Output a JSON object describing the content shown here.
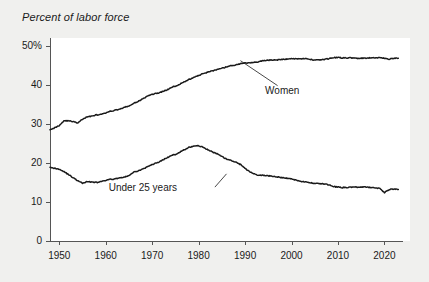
{
  "chart_data": {
    "type": "line",
    "title": "Percent of labor force",
    "xlabel": "",
    "ylabel": "",
    "xlim": [
      1948,
      2024
    ],
    "ylim": [
      0,
      52
    ],
    "grid": false,
    "legend_position": "inline-annotations",
    "y_ticks": [
      {
        "value": 0,
        "label": "0"
      },
      {
        "value": 10,
        "label": "10"
      },
      {
        "value": 20,
        "label": "20"
      },
      {
        "value": 30,
        "label": "30"
      },
      {
        "value": 40,
        "label": "40"
      },
      {
        "value": 50,
        "label": "50%"
      }
    ],
    "x_ticks": [
      {
        "value": 1950,
        "label": "1950"
      },
      {
        "value": 1960,
        "label": "1960"
      },
      {
        "value": 1970,
        "label": "1970"
      },
      {
        "value": 1980,
        "label": "1980"
      },
      {
        "value": 1990,
        "label": "1990"
      },
      {
        "value": 2000,
        "label": "2000"
      },
      {
        "value": 2010,
        "label": "2010"
      },
      {
        "value": 2020,
        "label": "2020"
      }
    ],
    "annotations": [
      {
        "text": "Women",
        "label_x": 1998,
        "label_y": 38.5,
        "leader_from": [
          1997,
          39.8
        ],
        "leader_to": [
          1989,
          46.2
        ]
      },
      {
        "text": "Under 25 years",
        "label_x": 1968,
        "label_y": 13.5,
        "leader_from": [
          1983.5,
          13.8
        ],
        "leader_to": [
          1986,
          17.2
        ]
      }
    ],
    "series": [
      {
        "name": "Women",
        "color": "#1a1a1a",
        "x": [
          1948,
          1949,
          1950,
          1951,
          1952,
          1953,
          1954,
          1955,
          1956,
          1957,
          1958,
          1959,
          1960,
          1961,
          1962,
          1963,
          1964,
          1965,
          1966,
          1967,
          1968,
          1969,
          1970,
          1971,
          1972,
          1973,
          1974,
          1975,
          1976,
          1977,
          1978,
          1979,
          1980,
          1981,
          1982,
          1983,
          1984,
          1985,
          1986,
          1987,
          1988,
          1989,
          1990,
          1991,
          1992,
          1993,
          1994,
          1995,
          1996,
          1997,
          1998,
          1999,
          2000,
          2001,
          2002,
          2003,
          2004,
          2005,
          2006,
          2007,
          2008,
          2009,
          2010,
          2011,
          2012,
          2013,
          2014,
          2015,
          2016,
          2017,
          2018,
          2019,
          2020,
          2021,
          2022,
          2023
        ],
        "values": [
          28.6,
          29.0,
          29.6,
          30.8,
          30.8,
          30.6,
          30.2,
          31.2,
          31.8,
          32.0,
          32.3,
          32.4,
          32.8,
          33.2,
          33.5,
          33.8,
          34.2,
          34.6,
          35.2,
          35.8,
          36.4,
          37.1,
          37.6,
          37.8,
          38.2,
          38.6,
          39.2,
          39.7,
          40.2,
          40.8,
          41.4,
          41.9,
          42.4,
          42.9,
          43.3,
          43.6,
          43.9,
          44.2,
          44.6,
          44.9,
          45.1,
          45.4,
          45.6,
          45.7,
          45.8,
          45.9,
          46.2,
          46.3,
          46.4,
          46.4,
          46.5,
          46.6,
          46.7,
          46.7,
          46.7,
          46.7,
          46.5,
          46.4,
          46.4,
          46.5,
          46.7,
          47.0,
          47.0,
          46.9,
          46.9,
          46.9,
          46.8,
          46.8,
          46.8,
          46.9,
          46.9,
          47.0,
          46.8,
          46.6,
          46.8,
          46.8
        ]
      },
      {
        "name": "Under 25 years",
        "color": "#1a1a1a",
        "x": [
          1948,
          1949,
          1950,
          1951,
          1952,
          1953,
          1954,
          1955,
          1956,
          1957,
          1958,
          1959,
          1960,
          1961,
          1962,
          1963,
          1964,
          1965,
          1966,
          1967,
          1968,
          1969,
          1970,
          1971,
          1972,
          1973,
          1974,
          1975,
          1976,
          1977,
          1978,
          1979,
          1980,
          1981,
          1982,
          1983,
          1984,
          1985,
          1986,
          1987,
          1988,
          1989,
          1990,
          1991,
          1992,
          1993,
          1994,
          1995,
          1996,
          1997,
          1998,
          1999,
          2000,
          2001,
          2002,
          2003,
          2004,
          2005,
          2006,
          2007,
          2008,
          2009,
          2010,
          2011,
          2012,
          2013,
          2014,
          2015,
          2016,
          2017,
          2018,
          2019,
          2020,
          2021,
          2022,
          2023
        ],
        "values": [
          19.0,
          18.6,
          18.4,
          17.8,
          17.0,
          16.2,
          15.4,
          14.8,
          15.2,
          15.1,
          15.0,
          15.2,
          15.5,
          15.8,
          15.9,
          16.2,
          16.3,
          16.8,
          17.6,
          18.0,
          18.4,
          19.0,
          19.6,
          20.0,
          20.6,
          21.2,
          21.8,
          22.2,
          22.8,
          23.4,
          24.0,
          24.3,
          24.4,
          24.0,
          23.4,
          22.8,
          22.3,
          21.6,
          21.0,
          20.6,
          20.2,
          19.6,
          18.6,
          17.8,
          17.2,
          16.8,
          16.8,
          16.7,
          16.6,
          16.4,
          16.2,
          16.1,
          15.9,
          15.6,
          15.3,
          15.1,
          14.9,
          14.8,
          14.7,
          14.6,
          14.4,
          14.0,
          13.8,
          13.7,
          13.7,
          13.8,
          13.8,
          13.8,
          13.8,
          13.7,
          13.6,
          13.5,
          12.4,
          13.2,
          13.3,
          13.2
        ]
      }
    ]
  },
  "axis": {
    "axis_color": "#555555",
    "line_color": "#1a1a1a"
  }
}
